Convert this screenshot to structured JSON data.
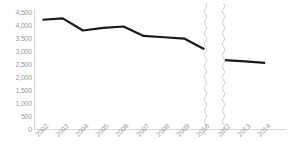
{
  "chart_data": {
    "type": "line",
    "title": "",
    "subtitle": "",
    "xlabel": "",
    "ylabel": "",
    "categories": [
      "2002",
      "2003",
      "2004",
      "2005",
      "2006",
      "2007",
      "2008",
      "2009",
      "2010",
      "2012",
      "2013",
      "2014"
    ],
    "values": [
      4100,
      4150,
      3700,
      3800,
      3850,
      3500,
      3450,
      3400,
      3000,
      2600,
      2550,
      2500
    ],
    "series": [
      {
        "name": "trend",
        "color": "#1a1a1a",
        "values": [
          4100,
          4150,
          3700,
          3800,
          3850,
          3500,
          3450,
          3400,
          3000,
          2600,
          2550,
          2500
        ]
      }
    ],
    "ylim": [
      0,
      4500
    ],
    "ytick_step": 500,
    "ytick_labels": [
      "4,500",
      "4,000",
      "3,500",
      "3,000",
      "2,500",
      "2,000",
      "1,500",
      "1,000",
      "500",
      "0"
    ],
    "ytick_values": [
      4500,
      4000,
      3500,
      3000,
      2500,
      2000,
      1500,
      1000,
      500,
      0
    ],
    "xtick_labels": [
      "2002",
      "2003",
      "2004",
      "2005",
      "2006",
      "2007",
      "2008",
      "2009",
      "2010",
      "2012",
      "2013",
      "2014"
    ],
    "axis_break": {
      "present": true,
      "style": "wavy-vertical-pair",
      "between": [
        "2010",
        "2012"
      ],
      "missing_category": "2011"
    },
    "grid": false,
    "legend": false,
    "legend_position": "none",
    "line_color": "#1a1a1a",
    "axis_color": "#d9d9d9",
    "tick_label_color": "#9a9a9a",
    "background": "#ffffff"
  },
  "footnote": {
    "text": ""
  }
}
